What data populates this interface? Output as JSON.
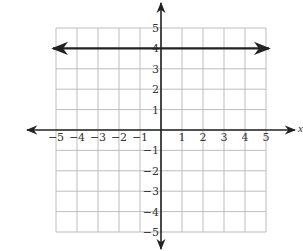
{
  "chart_data": {
    "type": "line",
    "title": "",
    "xlabel": "x",
    "ylabel": "",
    "xlim": [
      -5,
      5
    ],
    "ylim": [
      -5,
      5
    ],
    "grid": true,
    "x_ticks": [
      -5,
      -4,
      -3,
      -2,
      -1,
      1,
      2,
      3,
      4,
      5
    ],
    "y_ticks": [
      -5,
      -4,
      -3,
      -2,
      -1,
      1,
      2,
      3,
      4,
      5
    ],
    "x_tick_labels": [
      "−5",
      "−4",
      "−3",
      "−2",
      "−1",
      "1",
      "2",
      "3",
      "4",
      "5"
    ],
    "y_tick_labels": [
      "−5",
      "−4",
      "−3",
      "−2",
      "−1",
      "1",
      "2",
      "3",
      "4",
      "5"
    ],
    "series": [
      {
        "name": "y = 4",
        "x": [
          -5,
          5
        ],
        "y": [
          4,
          4
        ],
        "arrows_both_ends": true,
        "color": "#222222"
      }
    ]
  },
  "layout": {
    "origin_px": [
      161,
      130
    ],
    "unit_x_px": 21,
    "unit_y_px": 20.4,
    "grid_color": "#bdbdbd",
    "axis_color": "#222222"
  }
}
